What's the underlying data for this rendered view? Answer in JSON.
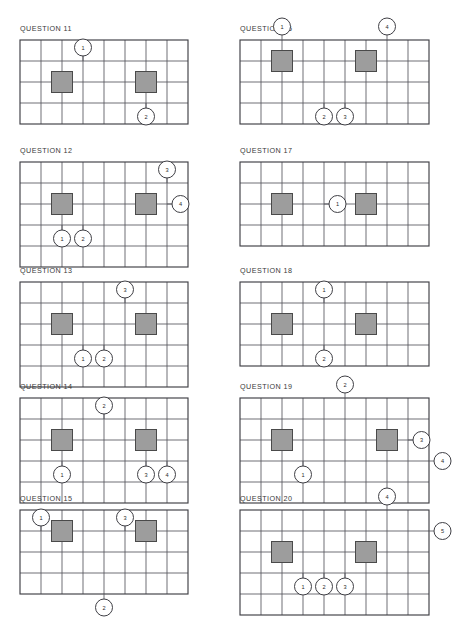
{
  "page": {
    "background": "#ffffff",
    "grid_color": "#55555c",
    "border_color": "#3f3f45",
    "tile_color": "#9d9d9d",
    "tile_border_color": "#4a4a4a",
    "marker_fill": "#ffffff",
    "marker_stroke": "#3f3f45",
    "cell_size": 21,
    "tile_size": 21,
    "marker_radius": 8.5
  },
  "panels": [
    {
      "id": "question-11",
      "title": "QUESTION 11",
      "x": 20,
      "y": 24,
      "grid_x": 0,
      "grid_y": 16,
      "cols": 8,
      "rows": 4,
      "tiles": [
        {
          "col": 2,
          "row": 2
        },
        {
          "col": 6,
          "row": 2
        }
      ],
      "markers": [
        {
          "label": "1",
          "cx": 3,
          "cy": 1,
          "side": "top"
        },
        {
          "label": "2",
          "cx": 6,
          "cy": 3,
          "side": "bottom"
        }
      ]
    },
    {
      "id": "question-12",
      "title": "QUESTION 12",
      "x": 20,
      "y": 146,
      "grid_x": 0,
      "grid_y": 16,
      "cols": 8,
      "rows": 5,
      "tiles": [
        {
          "col": 2,
          "row": 2
        },
        {
          "col": 6,
          "row": 2
        }
      ],
      "markers": [
        {
          "label": "3",
          "cx": 7,
          "cy": 1,
          "side": "top"
        },
        {
          "label": "4",
          "cx": 7,
          "cy": 2,
          "side": "right"
        },
        {
          "label": "1",
          "cx": 2,
          "cy": 3,
          "side": "bottom"
        },
        {
          "label": "2",
          "cx": 3,
          "cy": 3,
          "side": "bottom"
        }
      ]
    },
    {
      "id": "question-13",
      "title": "QUESTION 13",
      "x": 20,
      "y": 266,
      "grid_x": 0,
      "grid_y": 16,
      "cols": 8,
      "rows": 5,
      "tiles": [
        {
          "col": 2,
          "row": 2
        },
        {
          "col": 6,
          "row": 2
        }
      ],
      "markers": [
        {
          "label": "3",
          "cx": 5,
          "cy": 1,
          "side": "top"
        },
        {
          "label": "1",
          "cx": 3,
          "cy": 3,
          "side": "bottom"
        },
        {
          "label": "2",
          "cx": 4,
          "cy": 3,
          "side": "bottom"
        }
      ]
    },
    {
      "id": "question-14",
      "title": "QUESTION 14",
      "x": 20,
      "y": 382,
      "grid_x": 0,
      "grid_y": 16,
      "cols": 8,
      "rows": 5,
      "tiles": [
        {
          "col": 2,
          "row": 2
        },
        {
          "col": 6,
          "row": 2
        }
      ],
      "markers": [
        {
          "label": "2",
          "cx": 4,
          "cy": 1,
          "side": "top"
        },
        {
          "label": "1",
          "cx": 2,
          "cy": 3,
          "side": "bottom"
        },
        {
          "label": "3",
          "cx": 6,
          "cy": 3,
          "side": "bottom"
        },
        {
          "label": "4",
          "cx": 7,
          "cy": 3,
          "side": "bottom"
        }
      ]
    },
    {
      "id": "question-15",
      "title": "QUESTION 15",
      "x": 20,
      "y": 494,
      "grid_x": 0,
      "grid_y": 16,
      "cols": 8,
      "rows": 4,
      "tiles": [
        {
          "col": 2,
          "row": 1
        },
        {
          "col": 6,
          "row": 1
        }
      ],
      "markers": [
        {
          "label": "1",
          "cx": 1,
          "cy": 1,
          "side": "top"
        },
        {
          "label": "3",
          "cx": 5,
          "cy": 1,
          "side": "top"
        },
        {
          "label": "2",
          "cx": 4,
          "cy": 4,
          "side": "bottom"
        }
      ]
    },
    {
      "id": "question-16",
      "title": "QUESTION 16",
      "x": 240,
      "y": 24,
      "grid_x": 0,
      "grid_y": 16,
      "cols": 9,
      "rows": 4,
      "tiles": [
        {
          "col": 2,
          "row": 1
        },
        {
          "col": 6,
          "row": 1
        }
      ],
      "markers": [
        {
          "label": "1",
          "cx": 2,
          "cy": 0,
          "side": "top"
        },
        {
          "label": "4",
          "cx": 7,
          "cy": 0,
          "side": "top"
        },
        {
          "label": "2",
          "cx": 4,
          "cy": 3,
          "side": "bottom"
        },
        {
          "label": "3",
          "cx": 5,
          "cy": 3,
          "side": "bottom"
        }
      ]
    },
    {
      "id": "question-17",
      "title": "QUESTION 17",
      "x": 240,
      "y": 146,
      "grid_x": 0,
      "grid_y": 16,
      "cols": 9,
      "rows": 4,
      "tiles": [
        {
          "col": 2,
          "row": 2
        },
        {
          "col": 6,
          "row": 2
        }
      ],
      "markers": [
        {
          "label": "1",
          "cx": 4,
          "cy": 2,
          "side": "right"
        }
      ]
    },
    {
      "id": "question-18",
      "title": "QUESTION 18",
      "x": 240,
      "y": 266,
      "grid_x": 0,
      "grid_y": 16,
      "cols": 9,
      "rows": 4,
      "tiles": [
        {
          "col": 2,
          "row": 2
        },
        {
          "col": 6,
          "row": 2
        }
      ],
      "markers": [
        {
          "label": "1",
          "cx": 4,
          "cy": 1,
          "side": "top"
        },
        {
          "label": "2",
          "cx": 4,
          "cy": 3,
          "side": "bottom"
        }
      ]
    },
    {
      "id": "question-19",
      "title": "QUESTION 19",
      "x": 240,
      "y": 382,
      "grid_x": 0,
      "grid_y": 16,
      "cols": 9,
      "rows": 5,
      "tiles": [
        {
          "col": 2,
          "row": 2
        },
        {
          "col": 7,
          "row": 2
        }
      ],
      "markers": [
        {
          "label": "2",
          "cx": 5,
          "cy": 0,
          "side": "top"
        },
        {
          "label": "3",
          "cx": 8,
          "cy": 2,
          "side": "right"
        },
        {
          "label": "1",
          "cx": 3,
          "cy": 3,
          "side": "bottom"
        },
        {
          "label": "4",
          "cx": 9,
          "cy": 3,
          "side": "right"
        }
      ]
    },
    {
      "id": "question-20",
      "title": "QUESTION 20",
      "x": 240,
      "y": 494,
      "grid_x": 0,
      "grid_y": 16,
      "cols": 9,
      "rows": 5,
      "tiles": [
        {
          "col": 2,
          "row": 2
        },
        {
          "col": 6,
          "row": 2
        }
      ],
      "markers": [
        {
          "label": "4",
          "cx": 7,
          "cy": 0,
          "side": "top"
        },
        {
          "label": "5",
          "cx": 9,
          "cy": 1,
          "side": "right"
        },
        {
          "label": "1",
          "cx": 3,
          "cy": 3,
          "side": "bottom"
        },
        {
          "label": "2",
          "cx": 4,
          "cy": 3,
          "side": "bottom"
        },
        {
          "label": "3",
          "cx": 5,
          "cy": 3,
          "side": "bottom"
        }
      ]
    }
  ]
}
